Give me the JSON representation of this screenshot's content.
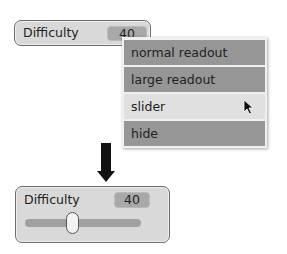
{
  "top_watcher": {
    "label": "Difficulty",
    "value": "40"
  },
  "menu": {
    "items": [
      {
        "label": "normal readout"
      },
      {
        "label": "large readout"
      },
      {
        "label": "slider",
        "selected": true
      },
      {
        "label": "hide"
      }
    ]
  },
  "bottom_watcher": {
    "label": "Difficulty",
    "value": "40",
    "slider_position": 0.4
  }
}
